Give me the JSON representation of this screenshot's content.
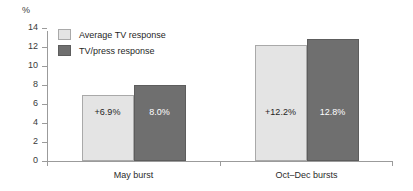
{
  "chart_data": {
    "type": "bar",
    "title": "",
    "xlabel": "",
    "ylabel": "%",
    "ylim": [
      0,
      14
    ],
    "ytick_step": 2,
    "yticks": [
      "14",
      "12",
      "10",
      "8",
      "6",
      "4",
      "2",
      "0"
    ],
    "grid": false,
    "legend_position": "upper-left-inside",
    "categories": [
      "May burst",
      "Oct–Dec bursts"
    ],
    "series": [
      {
        "name": "Average TV response",
        "color": "#e4e4e4",
        "values": [
          6.9,
          12.2
        ],
        "labels": [
          "+6.9%",
          "+12.2%"
        ]
      },
      {
        "name": "TV/press response",
        "color": "#6f6f6f",
        "values": [
          8.0,
          12.8
        ],
        "labels": [
          "8.0%",
          "12.8%"
        ]
      }
    ]
  },
  "axis": {
    "unit_label": "%"
  },
  "legend": {
    "items": [
      {
        "label": "Average TV response",
        "swatch": "light"
      },
      {
        "label": "TV/press response",
        "swatch": "dark"
      }
    ]
  }
}
